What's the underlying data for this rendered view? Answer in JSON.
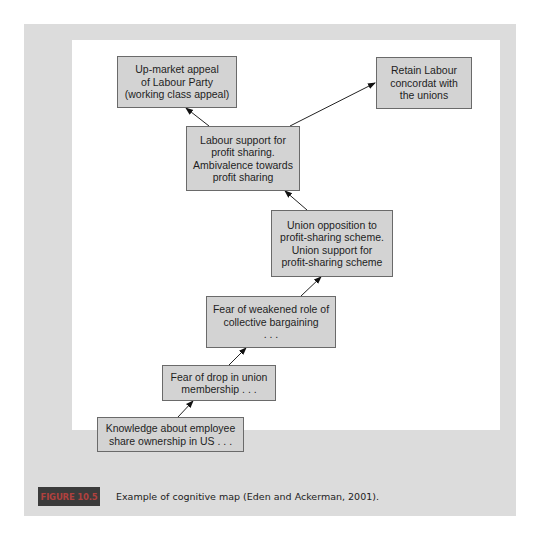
{
  "figure": {
    "label": "FIGURE 10.5",
    "caption": "Example of cognitive map (Eden and Ackerman, 2001)."
  },
  "colors": {
    "panel": "#dcdcdc",
    "canvas": "#ffffff",
    "node_fill": "#d3d3d3",
    "node_border": "#6a6a6a",
    "label_bg": "#3b3b3b",
    "label_text": "#b0413e"
  },
  "nodes": [
    {
      "id": "n1",
      "text": "Up-market appeal\nof Labour Party\n(working class appeal)"
    },
    {
      "id": "n2",
      "text": "Retain Labour\nconcordat with\nthe unions"
    },
    {
      "id": "n3",
      "text": "Labour support for\nprofit sharing.\nAmbivalence towards\nprofit sharing"
    },
    {
      "id": "n4",
      "text": "Union opposition to\nprofit-sharing scheme.\nUnion support for\nprofit-sharing scheme"
    },
    {
      "id": "n5",
      "text": "Fear of weakened role of\ncollective bargaining\n. . ."
    },
    {
      "id": "n6",
      "text": "Fear of drop in union\nmembership . . ."
    },
    {
      "id": "n7",
      "text": "Knowledge about employee\nshare ownership in US . . ."
    }
  ],
  "edges": [
    {
      "from": "n7",
      "to": "n6"
    },
    {
      "from": "n6",
      "to": "n5"
    },
    {
      "from": "n5",
      "to": "n4"
    },
    {
      "from": "n4",
      "to": "n3"
    },
    {
      "from": "n3",
      "to": "n1"
    },
    {
      "from": "n3",
      "to": "n2"
    }
  ]
}
